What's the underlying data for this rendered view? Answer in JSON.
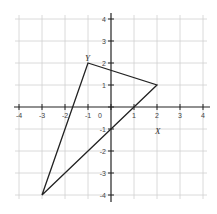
{
  "diagram": {
    "type": "coordinate-plane",
    "x_range": [
      -4,
      4
    ],
    "y_range": [
      -4,
      4
    ],
    "x_ticks": [
      "-4",
      "-3",
      "-2",
      "-1",
      "0",
      "1",
      "2",
      "3",
      "4"
    ],
    "y_ticks": [
      "4",
      "3",
      "2",
      "1",
      "-1",
      "-2",
      "-3",
      "-4"
    ],
    "origin_label": "0",
    "grid": true,
    "colors": {
      "grid": "#d0d0d0",
      "axis": "#222222",
      "shape": "#222222",
      "labels": "#444444"
    },
    "triangle": {
      "vertices": [
        {
          "x": -1,
          "y": 2,
          "label": "Y"
        },
        {
          "x": 2,
          "y": 1,
          "label": ""
        },
        {
          "x": -3,
          "y": -4,
          "label": ""
        }
      ]
    },
    "annotations": [
      {
        "text": "Y",
        "near": [
          -1,
          2
        ]
      },
      {
        "text": "X",
        "near": [
          2,
          -1.2
        ]
      }
    ]
  }
}
